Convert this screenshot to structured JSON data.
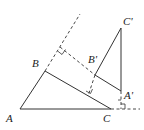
{
  "diagram": {
    "type": "geometry-figure",
    "labels": {
      "A": "A",
      "B": "B",
      "C": "C",
      "A_prime": "A'",
      "B_prime": "B'",
      "C_prime": "C'"
    },
    "points": {
      "A": [
        20,
        109
      ],
      "B": [
        45,
        71
      ],
      "C": [
        111,
        109
      ],
      "A_prime": [
        121,
        91
      ],
      "B_prime": [
        95,
        75
      ],
      "C_prime": [
        121,
        28
      ]
    },
    "right_angle_markers": 4,
    "colors": {
      "stroke": "#333333",
      "text": "#222222",
      "background": "#ffffff"
    }
  }
}
